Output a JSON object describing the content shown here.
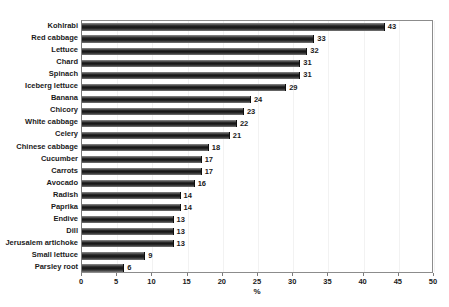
{
  "chart_data": {
    "type": "bar",
    "orientation": "horizontal",
    "title": "",
    "xlabel": "%",
    "ylabel": "",
    "xlim": [
      0,
      50
    ],
    "xticks": [
      0,
      5,
      10,
      15,
      20,
      25,
      30,
      35,
      40,
      45,
      50
    ],
    "grid": true,
    "grid_axis": "x",
    "legend": false,
    "bar_color": "#1a1a1a",
    "data_labels": true,
    "categories": [
      "Kohlrabi",
      "Red cabbage",
      "Lettuce",
      "Chard",
      "Spinach",
      "Iceberg lettuce",
      "Banana",
      "Chicory",
      "White cabbage",
      "Celery",
      "Chinese cabbage",
      "Cucumber",
      "Carrots",
      "Avocado",
      "Radish",
      "Paprika",
      "Endive",
      "Dill",
      "Jerusalem artichoke",
      "Small lettuce",
      "Parsley root"
    ],
    "values": [
      43,
      33,
      32,
      31,
      31,
      29,
      24,
      23,
      22,
      21,
      18,
      17,
      17,
      16,
      14,
      14,
      13,
      13,
      13,
      9,
      6
    ]
  }
}
